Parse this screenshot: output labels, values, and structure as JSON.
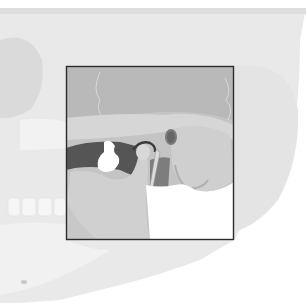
{
  "image": {
    "subject": "Anatomical illustration of skull with temporomandibular joint highlighted",
    "width": 306,
    "height": 303,
    "palette": {
      "background": "#ffffff",
      "skull_light": "#e8e8e8",
      "skull_mid": "#dcdcdc",
      "focus_bg": "#bdbdbd",
      "focus_dark": "#9a9a9a",
      "cavity_dark": "#5a5a5a",
      "bone_light": "#d2d2d2",
      "box_border": "#2b2b2b"
    },
    "highlight_box": {
      "x": 66,
      "y": 66,
      "width": 168,
      "height": 174
    }
  }
}
